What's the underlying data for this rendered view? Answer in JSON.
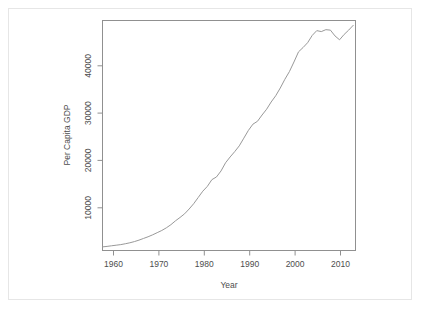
{
  "figure": {
    "background_color": "#ffffff",
    "frame_color": "#e6e6e6",
    "axis_color": "#808080",
    "line_color": "#999999"
  },
  "chart_data": {
    "type": "line",
    "title": "",
    "xlabel": "Year",
    "ylabel": "Per Capita GDP",
    "xlim": [
      1957,
      2012.5
    ],
    "ylim": [
      1800,
      49500
    ],
    "grid": false,
    "legend": null,
    "xticks": [
      1960,
      1970,
      1980,
      1990,
      2000,
      2010
    ],
    "xtick_labels": [
      "1960",
      "1970",
      "1980",
      "1990",
      "2000",
      "2010"
    ],
    "yticks": [
      10000,
      20000,
      30000,
      40000
    ],
    "ytick_labels": [
      "10000",
      "20000",
      "30000",
      "40000"
    ],
    "series": [
      {
        "name": "Per Capita GDP",
        "x": [
          1957,
          1958,
          1959,
          1960,
          1961,
          1962,
          1963,
          1964,
          1965,
          1966,
          1967,
          1968,
          1969,
          1970,
          1971,
          1972,
          1973,
          1974,
          1975,
          1976,
          1977,
          1978,
          1979,
          1980,
          1981,
          1982,
          1983,
          1984,
          1985,
          1986,
          1987,
          1988,
          1989,
          1990,
          1991,
          1992,
          1993,
          1994,
          1995,
          1996,
          1997,
          1998,
          1999,
          2000,
          2001,
          2002,
          2003,
          2004,
          2005,
          2006,
          2007,
          2008,
          2009,
          2010,
          2011,
          2012
        ],
        "y": [
          2550,
          2650,
          2780,
          2900,
          3020,
          3200,
          3400,
          3650,
          3950,
          4300,
          4650,
          5050,
          5500,
          5950,
          6500,
          7150,
          7950,
          8650,
          9400,
          10400,
          11500,
          12800,
          14100,
          15100,
          16500,
          17050,
          18300,
          20000,
          21200,
          22300,
          23500,
          25100,
          26700,
          28000,
          28600,
          29900,
          31100,
          32600,
          33900,
          35500,
          37300,
          38900,
          40900,
          43000,
          43900,
          44900,
          46400,
          47400,
          47200,
          47600,
          47500,
          46300,
          45500,
          46600,
          47500,
          48500
        ]
      }
    ],
    "annotations": []
  }
}
